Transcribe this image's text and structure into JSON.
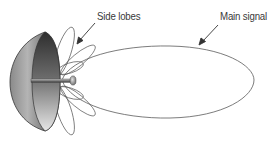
{
  "diagram": {
    "labels": {
      "side_lobes": "Side lobes",
      "main_signal": "Main signal"
    },
    "components": [
      {
        "name": "parabolic-dish",
        "description": "Half-sphere reflector dish, shaded gray"
      },
      {
        "name": "feed-horn",
        "description": "Central feed rod with small disc at focal point"
      },
      {
        "name": "main-lobe",
        "description": "Large elongated ellipse extending right"
      },
      {
        "name": "side-lobes",
        "description": "Multiple small petal-shaped lobes fanning around the feed"
      }
    ],
    "colors": {
      "outline": "#555555",
      "dish_dark": "#3c3c3c",
      "dish_light": "#d8d8d8",
      "text": "#3a3a3a",
      "background": "#ffffff"
    }
  }
}
